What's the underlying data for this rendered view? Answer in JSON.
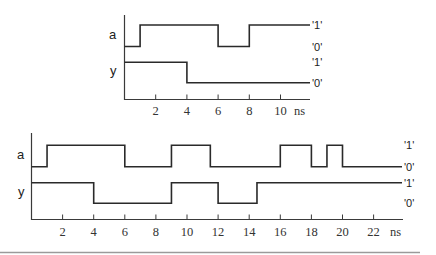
{
  "diagrams": [
    {
      "name": "top-timing-diagram",
      "origin_x": 124.5,
      "px_per_ns": 15.6,
      "axis": {
        "top_y": 15,
        "base_y": 99.5,
        "end_x": 310,
        "tick_label_y": 115
      },
      "ticks": [
        2,
        4,
        6,
        8,
        10
      ],
      "unit_label": "ns",
      "unit_x": 294,
      "line_end_x": 310,
      "level_label_x": 312,
      "signals": [
        {
          "label": "a",
          "label_x": 109,
          "label_y": 39,
          "high_y": 25,
          "low_y": 46.5,
          "initial": 0,
          "transitions_ns": [
            1,
            6,
            8
          ],
          "level_labels": {
            "one": "'1'",
            "zero": "'0'"
          }
        },
        {
          "label": "y",
          "label_x": 110,
          "label_y": 75,
          "high_y": 62.3,
          "low_y": 82.7,
          "initial": 1,
          "transitions_ns": [
            4
          ],
          "level_labels": {
            "one": "'1'",
            "zero": "'0'"
          }
        }
      ]
    },
    {
      "name": "bottom-timing-diagram",
      "origin_x": 31.5,
      "px_per_ns": 15.55,
      "axis": {
        "top_y": 133,
        "base_y": 219.5,
        "end_x": 403,
        "tick_label_y": 236
      },
      "ticks": [
        2,
        4,
        6,
        8,
        10,
        12,
        14,
        16,
        18,
        20,
        22
      ],
      "unit_label": "ns",
      "unit_x": 390,
      "line_end_x": 402,
      "level_label_x": 404,
      "signals": [
        {
          "label": "a",
          "label_x": 17,
          "label_y": 159,
          "high_y": 145.3,
          "low_y": 166.7,
          "initial": 0,
          "transitions_ns": [
            1,
            6,
            9,
            11.5,
            16,
            18,
            19,
            20
          ],
          "level_labels": {
            "one": "'1'",
            "zero": "'0'"
          }
        },
        {
          "label": "y",
          "label_x": 18,
          "label_y": 196,
          "high_y": 182.7,
          "low_y": 203.3,
          "initial": 1,
          "transitions_ns": [
            4,
            9,
            12,
            14.5
          ],
          "level_labels": {
            "one": "'1'",
            "zero": "'0'"
          }
        }
      ]
    }
  ],
  "rule": {
    "y": 252.5,
    "x1": 0,
    "x2": 420
  }
}
